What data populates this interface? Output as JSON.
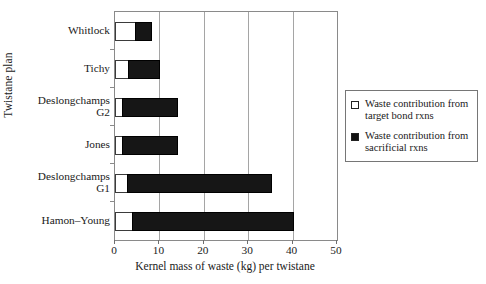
{
  "chart_data": {
    "type": "bar",
    "orientation": "horizontal",
    "stacked": true,
    "title": "",
    "xlabel": "Kernel mass of waste (kg) per twistane",
    "ylabel": "Twistane plan",
    "categories": [
      "Whitlock",
      "Tichy",
      "Deslongchamps\nG2",
      "Jones",
      "Deslongchamps\nG1",
      "Hamon–Young"
    ],
    "series": [
      {
        "name": "Waste contribution from target bond rxns",
        "color": "#ffffff",
        "values": [
          4.7,
          3.1,
          1.8,
          1.8,
          2.9,
          4.1
        ]
      },
      {
        "name": "Waste contribution from sacrificial rxns",
        "color": "#161616",
        "values": [
          3.8,
          7.2,
          12.6,
          12.6,
          32.6,
          36.4
        ]
      }
    ],
    "totals": [
      8.5,
      10.3,
      14.4,
      14.4,
      35.5,
      40.5
    ],
    "xlim": [
      0,
      50
    ],
    "xticks": [
      0,
      10,
      20,
      30,
      40,
      50
    ],
    "xtick_labels": [
      "0",
      "10",
      "20",
      "30",
      "40",
      "50"
    ],
    "grid": "vertical",
    "legend_position": "right"
  },
  "legend": {
    "entries": [
      {
        "swatch": "open-square",
        "label": "Waste contribution from target bond rxns"
      },
      {
        "swatch": "filled-square",
        "label": "Waste contribution from sacrificial rxns"
      }
    ]
  },
  "colors": {
    "open_fill": "#ffffff",
    "filled_fill": "#161616",
    "axis": "#8a8a8a",
    "grid": "#a5a5a5",
    "text": "#1a1a1a"
  }
}
